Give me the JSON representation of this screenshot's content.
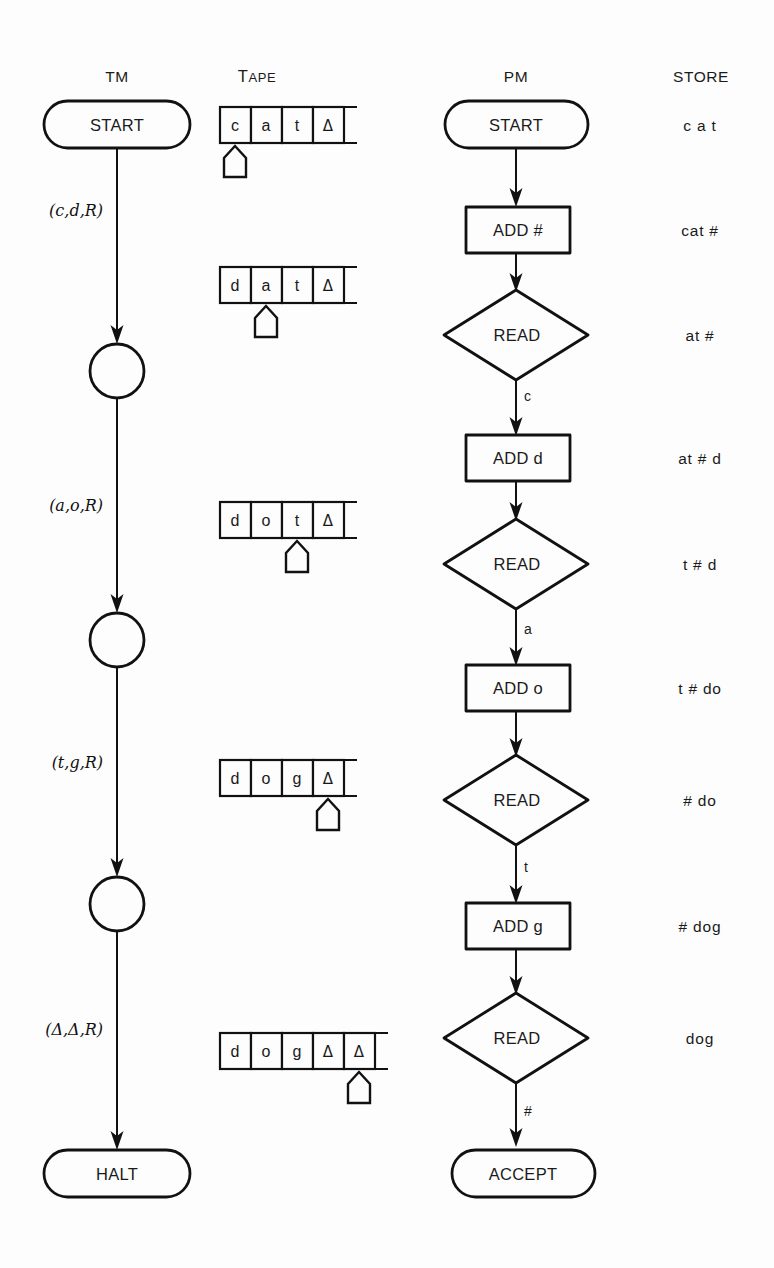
{
  "figure": {
    "background_color": "#fdfdfd",
    "ink_color": "#111111"
  },
  "columns": [
    {
      "id": "tm",
      "header": "TM",
      "header_style": "caps"
    },
    {
      "id": "tape",
      "header": "TAPE",
      "header_style": "small-caps",
      "header_first": "T",
      "header_rest": "APE"
    },
    {
      "id": "pm",
      "header": "PM",
      "header_style": "caps"
    },
    {
      "id": "store",
      "header": "STORE",
      "header_style": "caps"
    }
  ],
  "tm": {
    "nodes": [
      {
        "id": "tm-start",
        "shape": "capsule",
        "label": "START"
      },
      {
        "id": "tm-state-1",
        "shape": "circle",
        "label": ""
      },
      {
        "id": "tm-state-2",
        "shape": "circle",
        "label": ""
      },
      {
        "id": "tm-state-3",
        "shape": "circle",
        "label": ""
      },
      {
        "id": "tm-halt",
        "shape": "capsule",
        "label": "HALT"
      }
    ],
    "edges": [
      {
        "id": "tm-edge-1",
        "label": "(c,d,R)",
        "read": "c",
        "write": "d",
        "move": "R"
      },
      {
        "id": "tm-edge-2",
        "label": "(a,o,R)",
        "read": "a",
        "write": "o",
        "move": "R"
      },
      {
        "id": "tm-edge-3",
        "label": "(t,g,R)",
        "read": "t",
        "write": "g",
        "move": "R"
      },
      {
        "id": "tm-edge-4",
        "label": "(Δ,Δ,R)",
        "read": "Δ",
        "write": "Δ",
        "move": "R"
      }
    ]
  },
  "tape": {
    "blank_symbol": "Δ",
    "snapshots": [
      {
        "id": "tape-1",
        "cells": [
          "c",
          "a",
          "t",
          "Δ"
        ],
        "head_index": 0
      },
      {
        "id": "tape-2",
        "cells": [
          "d",
          "a",
          "t",
          "Δ"
        ],
        "head_index": 1
      },
      {
        "id": "tape-3",
        "cells": [
          "d",
          "o",
          "t",
          "Δ"
        ],
        "head_index": 2
      },
      {
        "id": "tape-4",
        "cells": [
          "d",
          "o",
          "g",
          "Δ"
        ],
        "head_index": 3
      },
      {
        "id": "tape-5",
        "cells": [
          "d",
          "o",
          "g",
          "Δ",
          "Δ"
        ],
        "head_index": 4
      }
    ]
  },
  "pm": {
    "nodes": [
      {
        "id": "pm-start",
        "shape": "capsule",
        "label": "START"
      },
      {
        "id": "pm-add-hash",
        "shape": "rectangle",
        "label": "ADD #"
      },
      {
        "id": "pm-read-1",
        "shape": "diamond",
        "label": "READ"
      },
      {
        "id": "pm-add-d",
        "shape": "rectangle",
        "label": "ADD d"
      },
      {
        "id": "pm-read-2",
        "shape": "diamond",
        "label": "READ"
      },
      {
        "id": "pm-add-o",
        "shape": "rectangle",
        "label": "ADD o"
      },
      {
        "id": "pm-read-3",
        "shape": "diamond",
        "label": "READ"
      },
      {
        "id": "pm-add-g",
        "shape": "rectangle",
        "label": "ADD g"
      },
      {
        "id": "pm-read-4",
        "shape": "diamond",
        "label": "READ"
      },
      {
        "id": "pm-accept",
        "shape": "capsule",
        "label": "ACCEPT"
      }
    ],
    "branch_labels": [
      {
        "id": "pm-branch-c",
        "label": "c",
        "from": "pm-read-1",
        "to": "pm-add-d"
      },
      {
        "id": "pm-branch-a",
        "label": "a",
        "from": "pm-read-2",
        "to": "pm-add-o"
      },
      {
        "id": "pm-branch-t",
        "label": "t",
        "from": "pm-read-3",
        "to": "pm-add-g"
      },
      {
        "id": "pm-branch-hash",
        "label": "#",
        "from": "pm-read-4",
        "to": "pm-accept"
      }
    ]
  },
  "store": {
    "values": [
      {
        "id": "store-1",
        "label": "c a t"
      },
      {
        "id": "store-2",
        "label": "cat #"
      },
      {
        "id": "store-3",
        "label": "at #"
      },
      {
        "id": "store-4",
        "label": "at # d"
      },
      {
        "id": "store-5",
        "label": "t # d"
      },
      {
        "id": "store-6",
        "label": "t # do"
      },
      {
        "id": "store-7",
        "label": "# do"
      },
      {
        "id": "store-8",
        "label": "# dog"
      },
      {
        "id": "store-9",
        "label": "dog"
      }
    ]
  }
}
